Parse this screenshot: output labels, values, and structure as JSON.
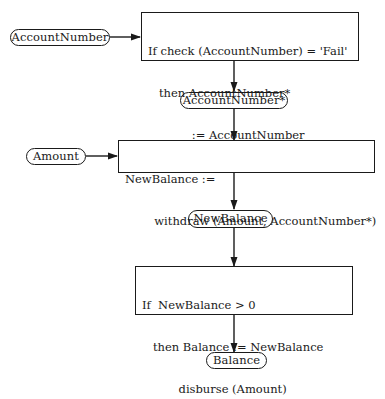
{
  "diagram": {
    "type": "data-flow",
    "colors": {
      "stroke": "#1a1a1a",
      "background": "#ffffff"
    },
    "nodes": {
      "account_number_in": {
        "label": "AccountNumber",
        "shape": "pill"
      },
      "check_process": {
        "shape": "rectangle",
        "lines": [
          "If check (AccountNumber) = 'Fail'",
          "   then AccountNumber*",
          "            := AccountNumber"
        ]
      },
      "account_number_star": {
        "label": "AccountNumber*",
        "shape": "pill"
      },
      "amount_in": {
        "label": "Amount",
        "shape": "pill"
      },
      "withdraw_process": {
        "shape": "rectangle",
        "lines": [
          "NewBalance :=",
          "        withdraw (Amount, AccountNumber*)"
        ]
      },
      "new_balance": {
        "label": "NewBalance",
        "shape": "pill"
      },
      "disburse_process": {
        "shape": "rectangle",
        "lines": [
          "If  NewBalance > 0",
          "   then Balance := NewBalance",
          "          disburse (Amount)"
        ]
      },
      "balance_out": {
        "label": "Balance",
        "shape": "pill"
      }
    },
    "edges": [
      {
        "from": "AccountNumber",
        "to": "check process"
      },
      {
        "from": "check process",
        "to": "AccountNumber*"
      },
      {
        "from": "AccountNumber*",
        "to": "withdraw process"
      },
      {
        "from": "Amount",
        "to": "withdraw process"
      },
      {
        "from": "withdraw process",
        "to": "NewBalance"
      },
      {
        "from": "NewBalance",
        "to": "disburse process"
      },
      {
        "from": "disburse process",
        "to": "Balance"
      }
    ]
  }
}
